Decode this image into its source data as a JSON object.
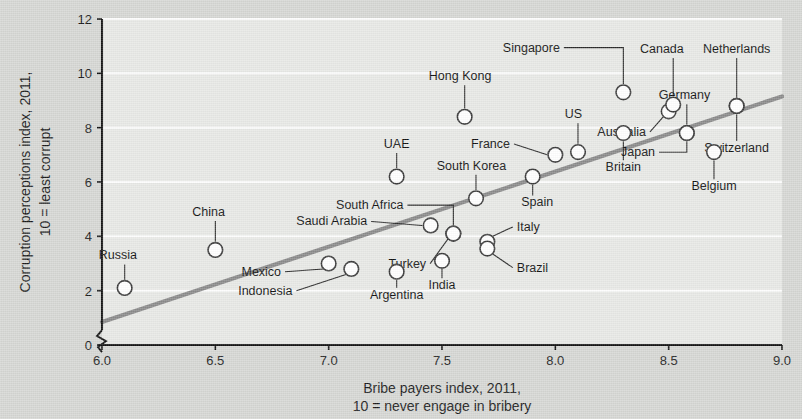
{
  "chart_data": {
    "type": "scatter",
    "title": "",
    "xlabel": "Bribe payers index, 2011,",
    "xlabel2": "10 = never engage in bribery",
    "ylabel": "Corruption perceptions index, 2011,",
    "ylabel2": "10 = least corrupt",
    "xlim": [
      6.0,
      9.0
    ],
    "ylim": [
      0,
      12
    ],
    "xticks": [
      "6.0",
      "6.5",
      "7.0",
      "7.5",
      "8.0",
      "8.5",
      "9.0"
    ],
    "xtick_values": [
      6.0,
      6.5,
      7.0,
      7.5,
      8.0,
      8.5,
      9.0
    ],
    "yticks": [
      "0",
      "2",
      "4",
      "6",
      "8",
      "10",
      "12"
    ],
    "ytick_values": [
      0,
      2,
      4,
      6,
      8,
      10,
      12
    ],
    "grid": "horizontal",
    "legend": "none",
    "axis_break": "y-axis broken below 1",
    "trendline": {
      "x0": 6.0,
      "y0": 0.85,
      "x1": 9.0,
      "y1": 9.15,
      "color": "#8a8a8a"
    },
    "marker": {
      "shape": "open-circle",
      "fill": "#ffffff",
      "stroke": "#3a3a3a"
    },
    "points": [
      {
        "name": "Russia",
        "x": 6.1,
        "y": 2.1,
        "label_x": 6.07,
        "label_y": 3.15,
        "anchor": "middle",
        "leader": "vertical"
      },
      {
        "name": "China",
        "x": 6.5,
        "y": 3.5,
        "label_x": 6.47,
        "label_y": 4.75,
        "anchor": "middle",
        "leader": "vertical"
      },
      {
        "name": "Mexico",
        "x": 7.0,
        "y": 3.0,
        "label_x": 6.79,
        "label_y": 2.55,
        "anchor": "end",
        "leader": "diagonal"
      },
      {
        "name": "Indonesia",
        "x": 7.1,
        "y": 2.8,
        "label_x": 6.84,
        "label_y": 1.85,
        "anchor": "end",
        "leader": "diagonal"
      },
      {
        "name": "Argentina",
        "x": 7.3,
        "y": 2.7,
        "label_x": 7.3,
        "label_y": 1.7,
        "anchor": "middle",
        "leader": "vertical"
      },
      {
        "name": "India",
        "x": 7.5,
        "y": 3.1,
        "label_x": 7.5,
        "label_y": 2.05,
        "anchor": "middle",
        "leader": "vertical"
      },
      {
        "name": "Saudi Arabia",
        "x": 7.45,
        "y": 4.4,
        "label_x": 7.17,
        "label_y": 4.4,
        "anchor": "end",
        "leader": "horizontal"
      },
      {
        "name": "South Africa",
        "x": 7.55,
        "y": 4.1,
        "label_x": 7.33,
        "label_y": 5.0,
        "anchor": "end",
        "leader": "elbow-up"
      },
      {
        "name": "Turkey",
        "x": 7.55,
        "y": 4.1,
        "label_x": 7.43,
        "label_y": 2.85,
        "anchor": "end",
        "leader": "diagonal-up"
      },
      {
        "name": "Italy",
        "x": 7.7,
        "y": 3.8,
        "label_x": 7.83,
        "label_y": 4.2,
        "anchor": "start",
        "leader": "diagonal"
      },
      {
        "name": "Brazil",
        "x": 7.7,
        "y": 3.55,
        "label_x": 7.83,
        "label_y": 2.7,
        "anchor": "start",
        "leader": "diagonal"
      },
      {
        "name": "UAE",
        "x": 7.3,
        "y": 6.2,
        "label_x": 7.3,
        "label_y": 7.25,
        "anchor": "middle",
        "leader": "vertical"
      },
      {
        "name": "South Korea",
        "x": 7.65,
        "y": 5.4,
        "label_x": 7.63,
        "label_y": 6.45,
        "anchor": "middle",
        "leader": "vertical"
      },
      {
        "name": "Hong Kong",
        "x": 7.6,
        "y": 8.4,
        "label_x": 7.58,
        "label_y": 9.75,
        "anchor": "middle",
        "leader": "vertical"
      },
      {
        "name": "Spain",
        "x": 7.9,
        "y": 6.2,
        "label_x": 7.92,
        "label_y": 5.1,
        "anchor": "middle",
        "leader": "vertical"
      },
      {
        "name": "France",
        "x": 8.0,
        "y": 7.0,
        "label_x": 7.8,
        "label_y": 7.25,
        "anchor": "end",
        "leader": "horizontal"
      },
      {
        "name": "US",
        "x": 8.1,
        "y": 7.1,
        "label_x": 8.08,
        "label_y": 8.35,
        "anchor": "middle",
        "leader": "vertical"
      },
      {
        "name": "Singapore",
        "x": 8.3,
        "y": 9.3,
        "label_x": 8.02,
        "label_y": 10.8,
        "anchor": "end",
        "leader": "elbow-up"
      },
      {
        "name": "Britain",
        "x": 8.3,
        "y": 7.8,
        "label_x": 8.3,
        "label_y": 6.4,
        "anchor": "middle",
        "leader": "vertical"
      },
      {
        "name": "Australia",
        "x": 8.5,
        "y": 8.6,
        "label_x": 8.4,
        "label_y": 7.7,
        "anchor": "end",
        "leader": "diagonal-up"
      },
      {
        "name": "Canada",
        "x": 8.52,
        "y": 8.85,
        "label_x": 8.47,
        "label_y": 10.75,
        "anchor": "middle",
        "leader": "vertical"
      },
      {
        "name": "Germany",
        "x": 8.58,
        "y": 7.8,
        "label_x": 8.57,
        "label_y": 9.05,
        "anchor": "middle",
        "leader": "vertical"
      },
      {
        "name": "Japan",
        "x": 8.58,
        "y": 7.8,
        "label_x": 8.44,
        "label_y": 6.95,
        "anchor": "end",
        "leader": "elbow-down"
      },
      {
        "name": "Belgium",
        "x": 8.7,
        "y": 7.1,
        "label_x": 8.7,
        "label_y": 5.7,
        "anchor": "middle",
        "leader": "vertical"
      },
      {
        "name": "Netherlands",
        "x": 8.8,
        "y": 8.8,
        "label_x": 8.8,
        "label_y": 10.75,
        "anchor": "middle",
        "leader": "vertical"
      },
      {
        "name": "Switzerland",
        "x": 8.8,
        "y": 8.8,
        "label_x": 8.8,
        "label_y": 7.1,
        "anchor": "middle",
        "leader": "vertical"
      }
    ]
  }
}
